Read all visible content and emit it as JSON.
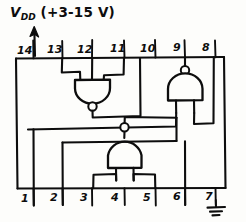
{
  "diagram": {
    "title_label": "V",
    "supply": {
      "name": "V",
      "subscript": "DD",
      "range_text": "(+3-15 V)",
      "arrow_icon": "up-arrow-icon",
      "attached_pin": "14"
    },
    "package": {
      "type": "14-pin DIP outline",
      "pin_count": 14
    },
    "top_pins": [
      {
        "number": "14"
      },
      {
        "number": "13"
      },
      {
        "number": "12"
      },
      {
        "number": "11"
      },
      {
        "number": "10"
      },
      {
        "number": "9"
      },
      {
        "number": "8"
      }
    ],
    "bottom_pins": [
      {
        "number": "1"
      },
      {
        "number": "2"
      },
      {
        "number": "3"
      },
      {
        "number": "4"
      },
      {
        "number": "5"
      },
      {
        "number": "6"
      },
      {
        "number": "7"
      }
    ],
    "ground": {
      "icon": "ground-symbol-icon",
      "attached_pin": "7"
    },
    "gates": [
      {
        "id": "gate-top-left",
        "type": "NAND",
        "orientation": "output-down",
        "input_pins": [
          "13",
          "12"
        ],
        "output_pin": "11"
      },
      {
        "id": "gate-top-right",
        "type": "NAND",
        "orientation": "output-up",
        "input_pins": [
          "9",
          "8"
        ],
        "output_pin": "10"
      },
      {
        "id": "gate-bottom-center",
        "type": "NAND",
        "orientation": "output-up",
        "input_pins": [
          "3",
          "5"
        ],
        "output_pin": "4"
      }
    ],
    "colors": {
      "ink": "#0d0d0d",
      "paper": "#fdfdfb"
    }
  }
}
